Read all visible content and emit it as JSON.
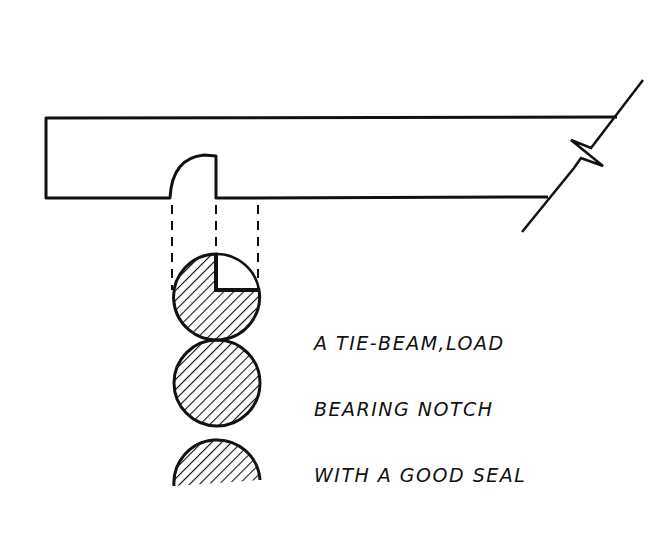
{
  "diagram": {
    "type": "construction-detail",
    "caption_lines": [
      "A TIE-BEAM,LOAD",
      "BEARING NOTCH",
      "WITH A GOOD SEAL"
    ],
    "elements": [
      {
        "id": "tie-beam",
        "shape": "rectangle with break line at right"
      },
      {
        "id": "notch",
        "shape": "quarter-round notch on beam underside"
      },
      {
        "id": "projection-lines",
        "count": 3,
        "style": "dashed"
      },
      {
        "id": "log-1",
        "shape": "hatched circle with quarter cutout (top-right)"
      },
      {
        "id": "log-2",
        "shape": "hatched circle"
      },
      {
        "id": "log-3",
        "shape": "hatched partial circle"
      }
    ],
    "colors": {
      "ink": "#111111",
      "paper": "#ffffff"
    }
  }
}
